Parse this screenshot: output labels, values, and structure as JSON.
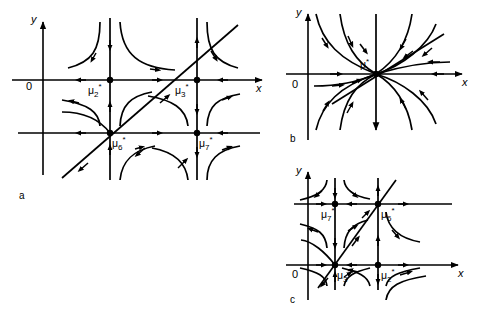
{
  "figure": {
    "background_color": "#ffffff",
    "stroke_color": "#000000",
    "panels": [
      {
        "id": "a",
        "panel_label": "a",
        "axis_x_label": "x",
        "axis_y_label": "y",
        "origin_label": "0",
        "equilibria": [
          {
            "name": "mu2",
            "label": "μ",
            "sub": "2",
            "sup": "*"
          },
          {
            "name": "mu3",
            "label": "μ",
            "sub": "3",
            "sup": "*"
          },
          {
            "name": "mu6",
            "label": "μ",
            "sub": "6",
            "sup": "*"
          },
          {
            "name": "mu7",
            "label": "μ",
            "sub": "7",
            "sup": "*"
          }
        ]
      },
      {
        "id": "b",
        "panel_label": "b",
        "axis_x_label": "x",
        "axis_y_label": "y",
        "origin_label": "0",
        "equilibria": [
          {
            "name": "mu",
            "label": "μ",
            "sub": "",
            "sup": "*"
          }
        ]
      },
      {
        "id": "c",
        "panel_label": "c",
        "axis_x_label": "x",
        "axis_y_label": "y",
        "origin_label": "0",
        "equilibria": [
          {
            "name": "mu7",
            "label": "μ",
            "sub": "7",
            "sup": "*"
          },
          {
            "name": "mu6",
            "label": "μ",
            "sub": "6",
            "sup": "*"
          },
          {
            "name": "mu3",
            "label": "μ",
            "sub": "3",
            "sup": "*"
          },
          {
            "name": "mu2",
            "label": "μ",
            "sub": "2",
            "sup": "*"
          }
        ]
      }
    ]
  }
}
